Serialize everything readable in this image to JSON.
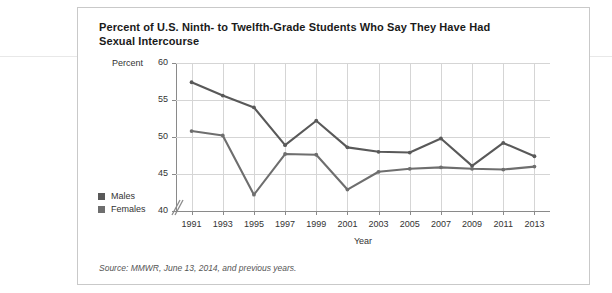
{
  "figure": {
    "title": "Percent of U.S. Ninth- to Twelfth-Grade Students Who Say They Have Had Sexual Intercourse",
    "source": "Source: MMWR, June 13, 2014, and previous years."
  },
  "legend": {
    "items": [
      {
        "label": "Males",
        "color": "#595959"
      },
      {
        "label": "Females",
        "color": "#6e6e6e"
      }
    ]
  },
  "chart_data": {
    "type": "line",
    "title": "Percent of U.S. Ninth- to Twelfth-Grade Students Who Say They Have Had Sexual Intercourse",
    "xlabel": "Year",
    "ylabel": "Percent",
    "categories": [
      1991,
      1993,
      1995,
      1997,
      1999,
      2001,
      2003,
      2005,
      2007,
      2009,
      2011,
      2013
    ],
    "x": [
      "1991",
      "1993",
      "1995",
      "1997",
      "1999",
      "2001",
      "2003",
      "2005",
      "2007",
      "2009",
      "2011",
      "2013"
    ],
    "xlim": [
      1990,
      2014
    ],
    "ylim": [
      40,
      60
    ],
    "yticks": [
      40,
      45,
      50,
      55,
      60
    ],
    "ytick_labels": [
      "40",
      "45",
      "50",
      "55",
      "60"
    ],
    "xticks": [
      1991,
      1993,
      1995,
      1997,
      1999,
      2001,
      2003,
      2005,
      2007,
      2009,
      2011,
      2013
    ],
    "grid": true,
    "y_axis_break": true,
    "legend_position": "lower-left-outside",
    "series": [
      {
        "name": "Males",
        "color": "#595959",
        "values": [
          57.4,
          55.6,
          54.0,
          48.9,
          52.2,
          48.6,
          48.0,
          47.9,
          49.8,
          46.1,
          49.2,
          47.4
        ]
      },
      {
        "name": "Females",
        "color": "#6e6e6e",
        "values": [
          50.8,
          50.2,
          42.2,
          47.7,
          47.6,
          42.9,
          45.3,
          45.7,
          45.9,
          45.7,
          45.6,
          46.0
        ]
      }
    ]
  }
}
